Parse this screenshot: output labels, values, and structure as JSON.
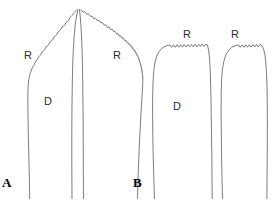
{
  "figure": {
    "width": 272,
    "height": 199,
    "background_color": "#ffffff",
    "stroke_color": "#6e6e6e",
    "label_color": "#2b2b2b",
    "panel_letter_color": "#000000"
  },
  "panels": [
    {
      "id": "A",
      "letter": "A",
      "labels": [
        {
          "id": "a-r-left",
          "text": "R"
        },
        {
          "id": "a-r-right",
          "text": "R"
        },
        {
          "id": "a-d",
          "text": "D"
        }
      ]
    },
    {
      "id": "B",
      "letter": "B",
      "labels": [
        {
          "id": "b-r-left",
          "text": "R"
        },
        {
          "id": "b-r-right",
          "text": "R"
        },
        {
          "id": "b-d",
          "text": "D"
        }
      ]
    }
  ]
}
